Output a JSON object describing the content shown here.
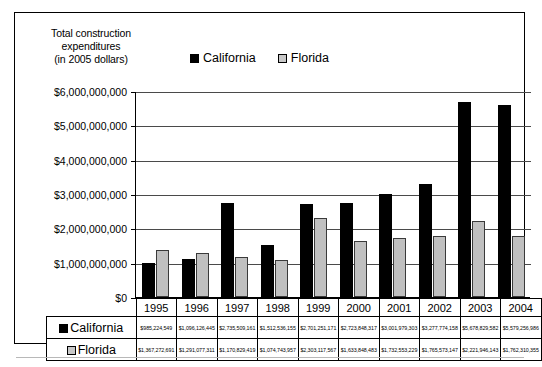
{
  "chart_data": {
    "type": "bar",
    "title": "Total construction expenditures (in 2005 dollars)",
    "title_lines": [
      "Total construction",
      "expenditures",
      "(in 2005 dollars)"
    ],
    "xlabel": "",
    "ylabel": "",
    "ylim": [
      0,
      6000000000
    ],
    "grid": true,
    "legend_position": "top",
    "categories": [
      "1995",
      "1996",
      "1997",
      "1998",
      "1999",
      "2000",
      "2001",
      "2002",
      "2003",
      "2004"
    ],
    "ytick_labels": [
      "$6,000,000,000",
      "$5,000,000,000",
      "$4,000,000,000",
      "$3,000,000,000",
      "$2,000,000,000",
      "$1,000,000,000",
      "$0"
    ],
    "ytick_values": [
      6000000000,
      5000000000,
      4000000000,
      3000000000,
      2000000000,
      1000000000,
      0
    ],
    "series": [
      {
        "name": "California",
        "color": "#000000",
        "values": [
          985224549,
          1096126445,
          2735509161,
          1512536155,
          2701251171,
          2723848317,
          3001979303,
          3277774158,
          5678829582,
          5579256986
        ],
        "labels": [
          "$985,224,549",
          "$1,096,126,445",
          "$2,735,509,161",
          "$1,512,536,155",
          "$2,701,251,171",
          "$2,723,848,317",
          "$3,001,979,303",
          "$3,277,774,158",
          "$5,678,829,582",
          "$5,579,256,986"
        ]
      },
      {
        "name": "Florida",
        "color": "#c0c0c0",
        "values": [
          1367272691,
          1291077311,
          1170829419,
          1074743957,
          2303117567,
          1633848483,
          1732553229,
          1765573147,
          2221946143,
          1762310355
        ],
        "labels": [
          "$1,367,272,691",
          "$1,291,077,311",
          "$1,170,829,419",
          "$1,074,743,957",
          "$2,303,117,567",
          "$1,633,848,483",
          "$1,732,553,229",
          "$1,765,573,147",
          "$2,221,946,143",
          "$1,762,310,355"
        ]
      }
    ]
  },
  "legend": {
    "items": [
      {
        "label": "California",
        "marker": "filled-square-black"
      },
      {
        "label": "Florida",
        "marker": "outlined-square-gray"
      }
    ]
  }
}
